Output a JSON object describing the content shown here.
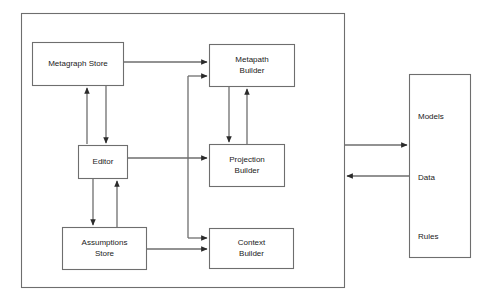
{
  "diagram": {
    "type": "block-diagram",
    "stroke_color": "#3a3a3a",
    "text_color": "#1a1a1a",
    "background_color": "#ffffff",
    "outer_frame": {
      "name": "system-boundary",
      "x": 21,
      "y": 13,
      "width": 324,
      "height": 275
    },
    "nodes": [
      {
        "id": "metagraph-store",
        "lines": [
          "Metagraph Store"
        ],
        "x": 32,
        "y": 42,
        "width": 92,
        "height": 44
      },
      {
        "id": "metapath-builder",
        "lines": [
          "Metapath",
          "Builder"
        ],
        "x": 209,
        "y": 44,
        "width": 86,
        "height": 43
      },
      {
        "id": "editor",
        "lines": [
          "Editor"
        ],
        "x": 78,
        "y": 145,
        "width": 50,
        "height": 34
      },
      {
        "id": "projection-builder",
        "lines": [
          "Projection",
          "Builder"
        ],
        "x": 209,
        "y": 144,
        "width": 76,
        "height": 43
      },
      {
        "id": "assumptions-store",
        "lines": [
          "Assumptions",
          "Store"
        ],
        "x": 62,
        "y": 227,
        "width": 85,
        "height": 43
      },
      {
        "id": "context-builder",
        "lines": [
          "Context",
          "Builder"
        ],
        "x": 209,
        "y": 228,
        "width": 85,
        "height": 41
      },
      {
        "id": "repository",
        "lines": [
          "Models",
          "Data",
          "Rules"
        ],
        "x": 409,
        "y": 74,
        "width": 62,
        "height": 184
      }
    ],
    "repository_labels": [
      {
        "id": "repository-models",
        "text": "Models",
        "x": 418,
        "y": 111
      },
      {
        "id": "repository-data",
        "text": "Data",
        "x": 418,
        "y": 172
      },
      {
        "id": "repository-rules",
        "text": "Rules",
        "x": 418,
        "y": 231
      }
    ],
    "edges": [
      {
        "id": "metagraph-store-to-metapath-builder",
        "from": "metagraph-store",
        "to": "metapath-builder"
      },
      {
        "id": "editor-trunk-to-metapath-builder",
        "from": "editor",
        "to": "metapath-builder"
      },
      {
        "id": "editor-trunk-to-context-builder",
        "from": "editor",
        "to": "context-builder"
      },
      {
        "id": "editor-to-metagraph-store",
        "from": "editor",
        "to": "metagraph-store"
      },
      {
        "id": "metagraph-store-to-editor",
        "from": "metagraph-store",
        "to": "editor"
      },
      {
        "id": "editor-to-projection-builder",
        "from": "editor",
        "to": "projection-builder"
      },
      {
        "id": "editor-to-assumptions-store",
        "from": "editor",
        "to": "assumptions-store"
      },
      {
        "id": "assumptions-store-to-editor",
        "from": "assumptions-store",
        "to": "editor"
      },
      {
        "id": "assumptions-store-to-context-builder",
        "from": "assumptions-store",
        "to": "context-builder"
      },
      {
        "id": "metapath-builder-to-projection-builder",
        "from": "metapath-builder",
        "to": "projection-builder"
      },
      {
        "id": "projection-builder-to-metapath-builder",
        "from": "projection-builder",
        "to": "metapath-builder"
      },
      {
        "id": "system-to-repository",
        "from": "system-boundary",
        "to": "repository"
      },
      {
        "id": "repository-to-system",
        "from": "repository",
        "to": "system-boundary"
      }
    ]
  }
}
